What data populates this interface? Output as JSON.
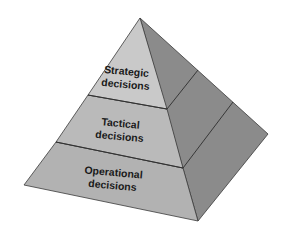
{
  "diagram": {
    "type": "pyramid",
    "levels": [
      {
        "line1": "Strategic",
        "line2": "decisions",
        "color": "#c9c9c9"
      },
      {
        "line1": "Tactical",
        "line2": "decisions",
        "color": "#bababa"
      },
      {
        "line1": "Operational",
        "line2": "decisions",
        "color": "#b2b2b2"
      }
    ],
    "side_color": "#8b8b8b",
    "edge_color": "#3a3a3a"
  }
}
